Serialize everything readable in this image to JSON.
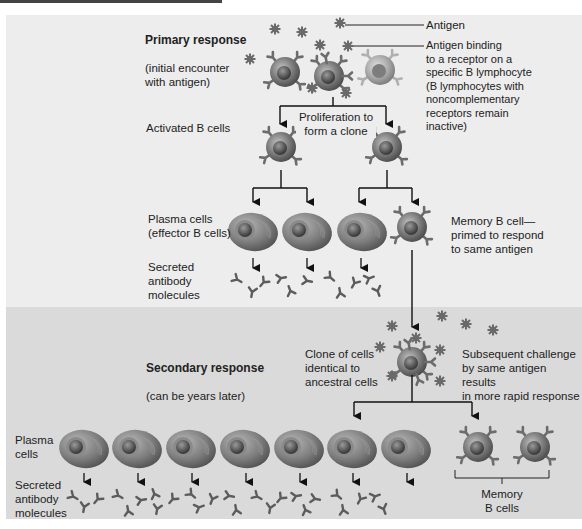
{
  "figure": {
    "primary": {
      "title": "Primary response",
      "subtitle": "(initial encounter\nwith antigen)",
      "antigen_label": "Antigen",
      "binding_label": "Antigen binding\nto a receptor on a\nspecific B lymphocyte\n(B lymphocytes with\nnoncomplementary\nreceptors remain\ninactive)",
      "activated_label": "Activated B cells",
      "proliferation_label": "Proliferation to\nform a clone",
      "plasma_label": "Plasma cells\n(effector B cells)",
      "memory_label": "Memory B cell—\nprimed to respond\nto same antigen",
      "secreted_label": "Secreted\nantibody\nmolecules"
    },
    "secondary": {
      "title": "Secondary response",
      "subtitle": "(can be years later)",
      "clone_label": "Clone of cells\nidentical to\nancestral cells",
      "challenge_label": "Subsequent challenge\nby same antigen results\nin more rapid response",
      "plasma_label": "Plasma\ncells",
      "secreted_label": "Secreted\nantibody\nmolecules",
      "memory_label": "Memory\nB cells"
    },
    "colors": {
      "panel_top": "#ededed",
      "panel_bottom": "#dadada",
      "cell": "#7a7a7a",
      "line": "#111111"
    }
  }
}
